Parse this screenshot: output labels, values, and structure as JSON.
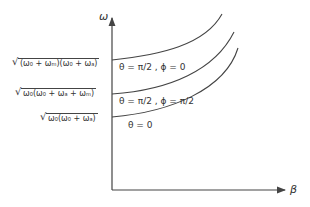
{
  "diagram": {
    "axes": {
      "y_label": "ω",
      "x_label": "β"
    },
    "y_intercepts": [
      {
        "label": "(ω₀ + ωₘ)(ω₀ + ωₐ)",
        "full": "√((ω₀ + ωₘ)(ω₀ + ωₐ))"
      },
      {
        "label": "ω₀(ω₀ + ωₐ + ωₘ)",
        "full": "√(ω₀(ω₀ + ωₐ + ωₘ))"
      },
      {
        "label": "ω₀(ω₀ + ωₐ)",
        "full": "√(ω₀(ω₀ + ωₐ))"
      }
    ],
    "curves": [
      {
        "label": "θ = π/2 , ϕ = 0"
      },
      {
        "label": "θ = π/2 , ϕ = π/2"
      },
      {
        "label": "θ = 0"
      }
    ],
    "colors": {
      "line": "#444444",
      "background": "#ffffff"
    }
  }
}
